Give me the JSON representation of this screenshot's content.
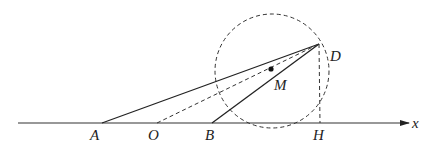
{
  "diagram": {
    "type": "geometry",
    "axis": {
      "label": "x",
      "y": 123,
      "x_start": 18,
      "x_end": 408
    },
    "points": {
      "A": {
        "label": "A",
        "x": 102,
        "y": 123,
        "lx": 90,
        "ly": 140
      },
      "O": {
        "label": "O",
        "x": 157,
        "y": 123,
        "lx": 148,
        "ly": 140
      },
      "B": {
        "label": "B",
        "x": 212,
        "y": 123,
        "lx": 205,
        "ly": 140
      },
      "H": {
        "label": "H",
        "x": 320,
        "y": 123,
        "lx": 313,
        "ly": 140
      },
      "D": {
        "label": "D",
        "x": 319,
        "y": 44,
        "lx": 330,
        "ly": 61
      },
      "M": {
        "label": "M",
        "x": 271,
        "y": 69,
        "lx": 274,
        "ly": 90
      }
    },
    "circle": {
      "cx": 272,
      "cy": 71,
      "r": 57,
      "style": "dashed"
    },
    "segments": [
      {
        "from": "A",
        "to": "D",
        "style": "solid"
      },
      {
        "from": "B",
        "to": "D",
        "style": "solid"
      },
      {
        "from": "O",
        "to": "D",
        "style": "dashed"
      },
      {
        "from": "D",
        "to": "H",
        "style": "dashed"
      }
    ],
    "colors": {
      "stroke": "#222222",
      "background": "#ffffff"
    }
  }
}
